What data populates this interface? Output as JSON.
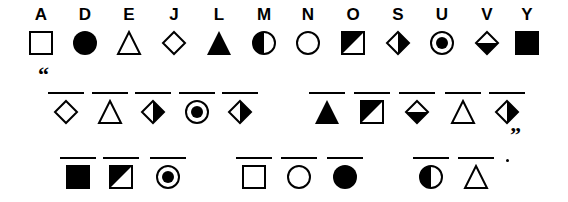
{
  "key": [
    {
      "letter": "A",
      "symbol": "square-open"
    },
    {
      "letter": "D",
      "symbol": "circle-filled"
    },
    {
      "letter": "E",
      "symbol": "triangle-open"
    },
    {
      "letter": "J",
      "symbol": "diamond-open"
    },
    {
      "letter": "L",
      "symbol": "triangle-filled"
    },
    {
      "letter": "M",
      "symbol": "circle-left-half-filled"
    },
    {
      "letter": "N",
      "symbol": "circle-open"
    },
    {
      "letter": "O",
      "symbol": "square-diagonal-half"
    },
    {
      "letter": "S",
      "symbol": "diamond-right-half-filled"
    },
    {
      "letter": "U",
      "symbol": "circle-dot"
    },
    {
      "letter": "V",
      "symbol": "diamond-bottom-half-filled"
    },
    {
      "letter": "Y",
      "symbol": "square-filled"
    }
  ],
  "puzzle": {
    "open_quote": "“",
    "close_quote": "”",
    "end_punct": ".",
    "words": [
      {
        "row": 2,
        "symbols": [
          "diamond-open",
          "triangle-open",
          "diamond-right-half-filled",
          "circle-dot",
          "diamond-right-half-filled"
        ],
        "answer": "JESUS"
      },
      {
        "row": 2,
        "symbols": [
          "triangle-filled",
          "square-diagonal-half",
          "diamond-bottom-half-filled",
          "triangle-open",
          "diamond-right-half-filled"
        ],
        "answer": "LOVES"
      },
      {
        "row": 3,
        "symbols": [
          "square-filled",
          "square-diagonal-half",
          "circle-dot"
        ],
        "answer": "YOU"
      },
      {
        "row": 3,
        "symbols": [
          "square-open",
          "circle-open",
          "circle-filled"
        ],
        "answer": "AND"
      },
      {
        "row": 3,
        "symbols": [
          "circle-left-half-filled",
          "triangle-open"
        ],
        "answer": "ME"
      }
    ]
  }
}
